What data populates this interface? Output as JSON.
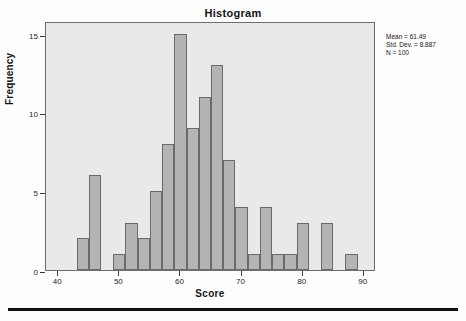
{
  "chart_data": {
    "type": "bar",
    "title": "Histogram",
    "xlabel": "Score",
    "ylabel": "Frequency",
    "xlim": [
      38,
      92
    ],
    "ylim": [
      0,
      15.8
    ],
    "bin_width": 2,
    "grid": false,
    "legend": null,
    "x_ticks": [
      "40",
      "50",
      "60",
      "70",
      "80",
      "90"
    ],
    "x_tick_values": [
      40,
      50,
      60,
      70,
      80,
      90
    ],
    "y_ticks": [
      "0",
      "5",
      "10",
      "15"
    ],
    "y_tick_values": [
      0,
      5,
      10,
      15
    ],
    "categories": [
      "43-45",
      "45-47",
      "49-51",
      "51-53",
      "53-55",
      "55-57",
      "57-59",
      "59-61",
      "61-63",
      "63-65",
      "65-67",
      "67-69",
      "69-71",
      "71-73",
      "73-75",
      "75-77",
      "77-79",
      "79-81",
      "83-85",
      "87-89"
    ],
    "bin_starts": [
      43,
      45,
      49,
      51,
      53,
      55,
      57,
      59,
      61,
      63,
      65,
      67,
      69,
      71,
      73,
      75,
      77,
      79,
      83,
      87
    ],
    "values": [
      2,
      6,
      1,
      3,
      2,
      5,
      8,
      15,
      9,
      11,
      13,
      7,
      4,
      1,
      4,
      1,
      1,
      3,
      3,
      1
    ],
    "bar_color": "#b4b4b4",
    "bar_edge_color": "#6a6a6a",
    "plot_background": "#e9e9e9",
    "annotations": [
      "Mean = 61.49",
      "Std. Dev. = 8.887",
      "N = 100"
    ]
  },
  "stats": {
    "mean": "Mean = 61.49",
    "std_dev": "Std. Dev. = 8.887",
    "n": "N = 100"
  }
}
